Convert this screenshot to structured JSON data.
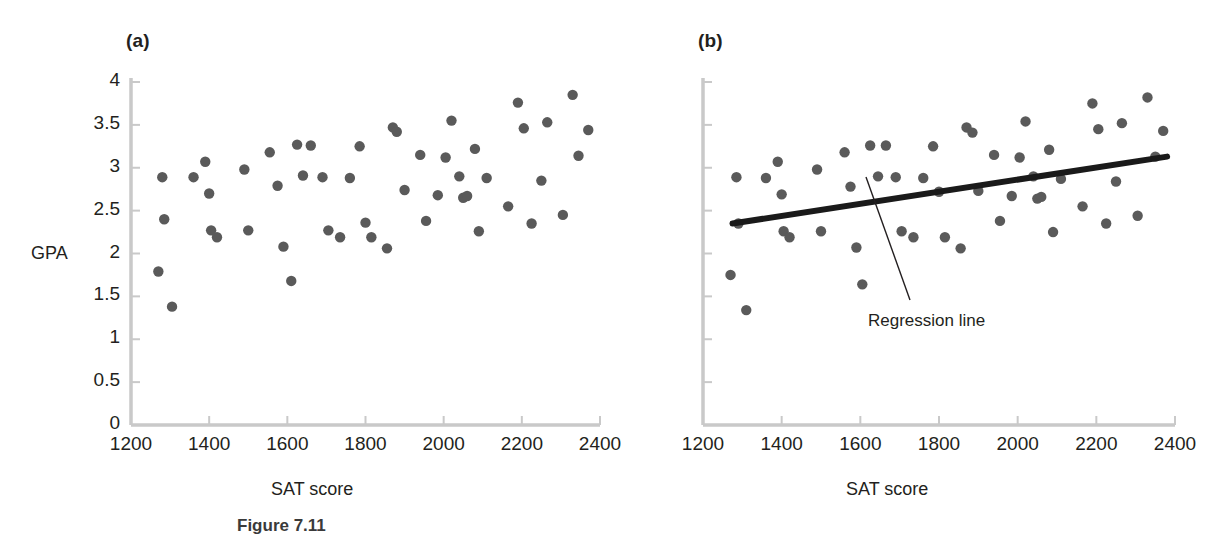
{
  "figure": {
    "caption": "Figure 7.11",
    "axis_color": "#c9c9c9",
    "point_color": "#5a5a5a",
    "line_color": "#1a1a1a",
    "text_color": "#231f20"
  },
  "panels": [
    {
      "id": "a",
      "label": "(a)",
      "xlabel": "SAT score",
      "ylabel": "GPA",
      "show_y_ticklabels": true,
      "show_regression": false
    },
    {
      "id": "b",
      "label": "(b)",
      "xlabel": "SAT score",
      "ylabel": "",
      "show_y_ticklabels": false,
      "show_regression": true,
      "annotation": "Regression line"
    }
  ],
  "chart_data": {
    "type": "scatter",
    "title": "",
    "xlabel": "SAT score",
    "ylabel": "GPA",
    "xlim": [
      1200,
      2400
    ],
    "ylim": [
      0,
      4
    ],
    "xticks": [
      1200,
      1400,
      1600,
      1800,
      2000,
      2200,
      2400
    ],
    "yticks": [
      0,
      0.5,
      1,
      1.5,
      2,
      2.5,
      3,
      3.5,
      4
    ],
    "ytick_labels": [
      "0",
      "0.5",
      "1",
      "1.5",
      "2",
      "2.5",
      "3",
      "3.5",
      "4"
    ],
    "xtick_labels": [
      "1200",
      "1400",
      "1600",
      "1800",
      "2000",
      "2200",
      "2400"
    ],
    "grid": false,
    "legend": false,
    "panels": [
      {
        "id": "a",
        "label": "(a)",
        "points": [
          [
            1270,
            1.79
          ],
          [
            1280,
            2.89
          ],
          [
            1285,
            2.4
          ],
          [
            1305,
            1.38
          ],
          [
            1360,
            2.89
          ],
          [
            1390,
            3.07
          ],
          [
            1400,
            2.7
          ],
          [
            1405,
            2.27
          ],
          [
            1420,
            2.19
          ],
          [
            1490,
            2.98
          ],
          [
            1500,
            2.27
          ],
          [
            1555,
            3.18
          ],
          [
            1575,
            2.79
          ],
          [
            1590,
            2.08
          ],
          [
            1610,
            1.68
          ],
          [
            1625,
            3.27
          ],
          [
            1640,
            2.91
          ],
          [
            1660,
            3.26
          ],
          [
            1690,
            2.89
          ],
          [
            1705,
            2.27
          ],
          [
            1735,
            2.19
          ],
          [
            1760,
            2.88
          ],
          [
            1785,
            3.25
          ],
          [
            1800,
            2.36
          ],
          [
            1815,
            2.19
          ],
          [
            1855,
            2.06
          ],
          [
            1870,
            3.47
          ],
          [
            1880,
            3.42
          ],
          [
            1900,
            2.74
          ],
          [
            1940,
            3.15
          ],
          [
            1955,
            2.38
          ],
          [
            1985,
            2.68
          ],
          [
            2005,
            3.12
          ],
          [
            2020,
            3.55
          ],
          [
            2040,
            2.9
          ],
          [
            2050,
            2.65
          ],
          [
            2060,
            2.67
          ],
          [
            2080,
            3.22
          ],
          [
            2090,
            2.26
          ],
          [
            2110,
            2.88
          ],
          [
            2165,
            2.55
          ],
          [
            2190,
            3.76
          ],
          [
            2205,
            3.46
          ],
          [
            2225,
            2.35
          ],
          [
            2250,
            2.85
          ],
          [
            2265,
            3.53
          ],
          [
            2305,
            2.45
          ],
          [
            2330,
            3.85
          ],
          [
            2345,
            3.14
          ],
          [
            2370,
            3.44
          ]
        ]
      },
      {
        "id": "b",
        "label": "(b)",
        "points": [
          [
            1270,
            1.75
          ],
          [
            1285,
            2.89
          ],
          [
            1290,
            2.35
          ],
          [
            1310,
            1.34
          ],
          [
            1360,
            2.88
          ],
          [
            1390,
            3.07
          ],
          [
            1400,
            2.69
          ],
          [
            1405,
            2.26
          ],
          [
            1420,
            2.19
          ],
          [
            1490,
            2.98
          ],
          [
            1500,
            2.26
          ],
          [
            1560,
            3.18
          ],
          [
            1575,
            2.78
          ],
          [
            1590,
            2.07
          ],
          [
            1605,
            1.64
          ],
          [
            1625,
            3.26
          ],
          [
            1645,
            2.9
          ],
          [
            1665,
            3.26
          ],
          [
            1690,
            2.89
          ],
          [
            1705,
            2.26
          ],
          [
            1735,
            2.19
          ],
          [
            1760,
            2.88
          ],
          [
            1785,
            3.25
          ],
          [
            1800,
            2.72
          ],
          [
            1815,
            2.19
          ],
          [
            1855,
            2.06
          ],
          [
            1870,
            3.47
          ],
          [
            1885,
            3.41
          ],
          [
            1900,
            2.73
          ],
          [
            1940,
            3.15
          ],
          [
            1955,
            2.38
          ],
          [
            1985,
            2.67
          ],
          [
            2005,
            3.12
          ],
          [
            2020,
            3.54
          ],
          [
            2040,
            2.9
          ],
          [
            2050,
            2.64
          ],
          [
            2060,
            2.66
          ],
          [
            2080,
            3.21
          ],
          [
            2090,
            2.25
          ],
          [
            2110,
            2.87
          ],
          [
            2165,
            2.55
          ],
          [
            2190,
            3.75
          ],
          [
            2205,
            3.45
          ],
          [
            2225,
            2.35
          ],
          [
            2250,
            2.84
          ],
          [
            2265,
            3.52
          ],
          [
            2305,
            2.44
          ],
          [
            2330,
            3.82
          ],
          [
            2350,
            3.13
          ],
          [
            2370,
            3.43
          ]
        ],
        "regression": {
          "x0": 1275,
          "y0": 2.35,
          "x1": 2380,
          "y1": 3.13,
          "label": "Regression line"
        }
      }
    ]
  }
}
